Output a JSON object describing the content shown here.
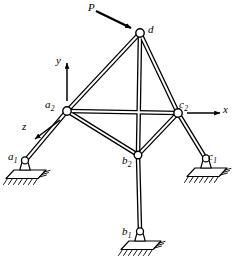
{
  "figure": {
    "type": "engineering-diagram",
    "width": 235,
    "height": 262,
    "background_color": "#ffffff",
    "line_color": "#000000"
  },
  "load": {
    "label": "P",
    "arrow_from": [
      95,
      12
    ],
    "arrow_to": [
      134,
      30
    ],
    "target_node": "d",
    "description": "inclined point load applied at apex node d"
  },
  "axes": {
    "origin_node": "a2",
    "items": [
      {
        "name": "y-axis",
        "label": "y",
        "direction": "up",
        "from": [
          67,
          101
        ],
        "to": [
          67,
          62
        ],
        "label_pos": [
          57,
          56
        ]
      },
      {
        "name": "x-axis",
        "label": "x",
        "direction": "right",
        "from": [
          187,
          113
        ],
        "to": [
          222,
          113
        ],
        "label_pos": [
          224,
          105
        ]
      },
      {
        "name": "z-axis",
        "label": "z",
        "direction": "down-left (out of page)",
        "from": [
          60,
          120
        ],
        "to": [
          33,
          140
        ],
        "label_pos": [
          23,
          122
        ]
      }
    ]
  },
  "nodes": [
    {
      "id": "d",
      "label": "d",
      "sub": "",
      "x": 140,
      "y": 33,
      "label_pos": [
        148,
        26
      ],
      "kind": "joint"
    },
    {
      "id": "a2",
      "label": "a",
      "sub": "2",
      "x": 67,
      "y": 111,
      "label_pos": [
        45,
        100
      ],
      "kind": "joint"
    },
    {
      "id": "c2",
      "label": "c",
      "sub": "2",
      "x": 178,
      "y": 113,
      "label_pos": [
        179,
        100
      ],
      "kind": "joint"
    },
    {
      "id": "b2",
      "label": "b",
      "sub": "2",
      "x": 138,
      "y": 155,
      "label_pos": [
        124,
        156
      ],
      "kind": "joint"
    },
    {
      "id": "a1",
      "label": "a",
      "sub": "1",
      "x": 25,
      "y": 169,
      "label_pos": [
        11,
        154
      ],
      "kind": "support"
    },
    {
      "id": "c1",
      "label": "c",
      "sub": "1",
      "x": 206,
      "y": 167,
      "label_pos": [
        208,
        155
      ],
      "kind": "support"
    },
    {
      "id": "b1",
      "label": "b",
      "sub": "1",
      "x": 140,
      "y": 240,
      "label_pos": [
        124,
        230
      ],
      "kind": "support"
    }
  ],
  "members": [
    {
      "from": "d",
      "to": "a2",
      "name": "member-d-a2"
    },
    {
      "from": "d",
      "to": "c2",
      "name": "member-d-c2"
    },
    {
      "from": "d",
      "to": "b2",
      "name": "member-d-b2"
    },
    {
      "from": "a2",
      "to": "c2",
      "name": "member-a2-c2"
    },
    {
      "from": "a2",
      "to": "b2",
      "name": "member-a2-b2"
    },
    {
      "from": "b2",
      "to": "c2",
      "name": "member-b2-c2"
    },
    {
      "from": "a2",
      "to": "a1",
      "name": "member-a2-a1"
    },
    {
      "from": "c2",
      "to": "c1",
      "name": "member-c2-c1"
    },
    {
      "from": "b2",
      "to": "b1",
      "name": "member-b2-b1"
    }
  ],
  "supports": [
    {
      "id": "a1",
      "x": 25,
      "y": 169,
      "name": "pin-support-a1",
      "type": "pinned",
      "ground": "hatched"
    },
    {
      "id": "c1",
      "x": 206,
      "y": 167,
      "name": "pin-support-c1",
      "type": "pinned",
      "ground": "hatched"
    },
    {
      "id": "b1",
      "x": 140,
      "y": 240,
      "name": "pin-support-b1",
      "type": "pinned",
      "ground": "hatched"
    }
  ]
}
